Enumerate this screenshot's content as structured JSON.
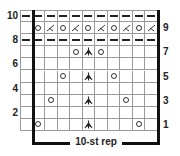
{
  "chart_data": {
    "type": "table",
    "repeat_label": "10-st rep",
    "columns": 11,
    "rows": 10,
    "left_row_numbers": [
      "10",
      "8",
      "6",
      "4",
      "2"
    ],
    "right_row_numbers": [
      "9",
      "7",
      "5",
      "3",
      "1"
    ],
    "legend_symbols": {
      "-": "purl",
      "o": "yarn over",
      "k2tog": "knit 2 together",
      "cdd": "central double decrease",
      "": "knit"
    },
    "grid": [
      [
        "-",
        "-",
        "-",
        "-",
        "-",
        "-",
        "-",
        "-",
        "-",
        "-",
        "-"
      ],
      [
        "",
        "o",
        "k2tog",
        "o",
        "k2tog",
        "o",
        "k2tog",
        "o",
        "k2tog",
        "o",
        "k2tog"
      ],
      [
        "-",
        "-",
        "-",
        "-",
        "-",
        "-",
        "-",
        "-",
        "-",
        "-",
        "-"
      ],
      [
        "",
        "",
        "",
        "",
        "o",
        "cdd",
        "o",
        "",
        "",
        "",
        ""
      ],
      [
        "",
        "",
        "",
        "",
        "",
        "",
        "",
        "",
        "",
        "",
        ""
      ],
      [
        "",
        "",
        "",
        "o",
        "",
        "cdd",
        "",
        "o",
        "",
        "",
        ""
      ],
      [
        "",
        "",
        "",
        "",
        "",
        "",
        "",
        "",
        "",
        "",
        ""
      ],
      [
        "",
        "",
        "o",
        "",
        "",
        "cdd",
        "",
        "",
        "o",
        "",
        ""
      ],
      [
        "",
        "",
        "",
        "",
        "",
        "",
        "",
        "",
        "",
        "",
        ""
      ],
      [
        "",
        "o",
        "",
        "",
        "",
        "cdd",
        "",
        "",
        "",
        "o",
        ""
      ]
    ]
  }
}
